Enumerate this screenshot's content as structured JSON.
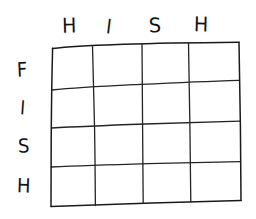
{
  "canvas": {
    "width": 256,
    "height": 219,
    "background_color": "#ffffff",
    "ink_color": "#1a1a1a",
    "style": "hand-drawn pen sketch"
  },
  "puzzle": {
    "title": "",
    "type": "empty-grid",
    "rows": 4,
    "columns": 4,
    "column_headers": [
      "H",
      "I",
      "S",
      "H"
    ],
    "row_headers": [
      "F",
      "I",
      "S",
      "H"
    ],
    "column_header_word": "HISH",
    "row_header_word": "FISH",
    "cells": [
      [
        "",
        "",
        "",
        ""
      ],
      [
        "",
        "",
        "",
        ""
      ],
      [
        "",
        "",
        "",
        ""
      ],
      [
        "",
        "",
        "",
        ""
      ]
    ]
  },
  "geometry": {
    "vertical_lines_x": [
      52,
      92,
      142,
      188,
      238
    ],
    "horizontal_lines_y": [
      47,
      89,
      127,
      166,
      206
    ],
    "note": "hand-drawn wobble; grid skews slightly upward to the right"
  }
}
